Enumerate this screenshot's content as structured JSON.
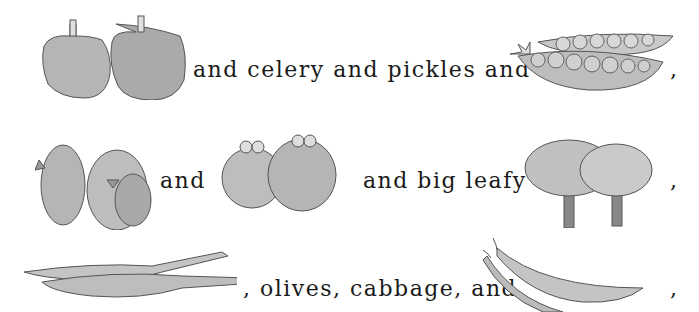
{
  "rebus": {
    "line1": {
      "text1": "and celery and pickles and",
      "comma": ","
    },
    "line2": {
      "text1": "and",
      "text2": "and big leafy",
      "comma": ","
    },
    "line3": {
      "text1": ", olives, cabbage, and",
      "comma": ","
    }
  },
  "pictures": [
    "bell-peppers",
    "pea-pods",
    "parrots",
    "frogs",
    "trees",
    "alligators",
    "green-beans"
  ],
  "colors": {
    "fill": "#b8b8b8",
    "stroke": "#555555",
    "text": "#1a1a1a"
  }
}
